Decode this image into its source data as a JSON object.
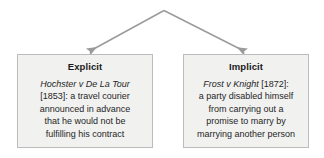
{
  "diagram": {
    "type": "tree-branch",
    "colors": {
      "box_fill": "#f1f1f0",
      "box_border": "#bcbcbc",
      "arrow": "#9b9b9b",
      "text": "#262626"
    },
    "connectors": [
      {
        "name": "arrow-to-explicit",
        "from": [
          164,
          10
        ],
        "to": [
          88,
          52
        ],
        "arrowhead": "triangle"
      },
      {
        "name": "arrow-to-implicit",
        "from": [
          164,
          10
        ],
        "to": [
          246,
          52
        ],
        "arrowhead": "triangle"
      }
    ],
    "nodes": [
      {
        "id": "explicit",
        "title": "Explicit",
        "case_name": "Hochster v De La Tour",
        "lines": [
          "[1853]: a travel courier",
          "announced in advance",
          "that he would not be",
          "fulfilling his contract"
        ]
      },
      {
        "id": "implicit",
        "title": "Implicit",
        "case_name": "Frost v Knight",
        "case_suffix": " [1872]:",
        "lines": [
          "a party disabled himself",
          "from carrying out a",
          "promise to marry by",
          "marrying another person"
        ]
      }
    ]
  }
}
